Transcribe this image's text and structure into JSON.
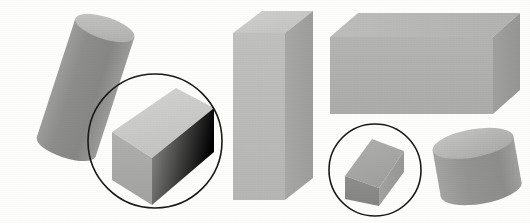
{
  "figure": {
    "background_color": "#fdfdfc",
    "width": 530,
    "height": 223,
    "annotation_stroke_color": "#1a1a1a",
    "annotation_stroke_width": 1.6,
    "shape_count": 6,
    "circled_count": 2
  },
  "palette": {
    "light_face": "#c9c9c7",
    "lighter_face": "#d2d2d0",
    "mid_face": "#b3b3b1",
    "mid_face_alt": "#adadab",
    "dark_face": "#8f8f8e",
    "darker_face": "#7f7f7e",
    "cylinder_body": "#8c8c8b",
    "cylinder_body_light": "#9a9a99",
    "cylinder_top": "#bcbcba",
    "outline": "#1a1a1a"
  },
  "shapes": [
    {
      "id": "tilted-cylinder",
      "name": "tilted-cylinder",
      "type": "cylinder",
      "label": "Tilted cylinder (upper left)",
      "circled": false,
      "center": [
        86,
        86
      ],
      "approx_bbox": [
        28,
        18,
        122,
        155
      ],
      "tilt_degrees": 18,
      "body_color": "#8c8c8b",
      "top_color": "#bcbcba"
    },
    {
      "id": "circled-cuboid-left",
      "name": "circled-cuboid-left",
      "type": "cuboid",
      "label": "Cuboid in circle (left)",
      "circled": true,
      "circle_center": [
        155,
        141
      ],
      "circle_radius": 67,
      "top_color": "#cfcfcd",
      "front_color": "#a9a9a7",
      "side_color": "#8f8f8e"
    },
    {
      "id": "tall-box",
      "name": "tall-box",
      "type": "cuboid",
      "label": "Tall vertical box (center)",
      "circled": false,
      "approx_bbox": [
        233,
        10,
        80,
        190
      ],
      "top_color": "#cbcbc9",
      "front_color": "#bcbcba",
      "side_color": "#a2a2a0"
    },
    {
      "id": "wide-box",
      "name": "wide-box",
      "type": "cuboid",
      "label": "Wide horizontal box (upper right)",
      "circled": false,
      "approx_bbox": [
        330,
        12,
        190,
        105
      ],
      "top_color": "#b8b8b6",
      "front_color": "#b0b0ae",
      "side_color": "#9a9a98"
    },
    {
      "id": "circled-cuboid-right",
      "name": "circled-cuboid-right",
      "type": "cuboid",
      "label": "Cuboid in circle (right)",
      "circled": true,
      "circle_center": [
        375,
        170
      ],
      "circle_radius": 46,
      "top_color": "#a8a8a6",
      "front_color": "#8a8a89",
      "side_color": "#9f9f9d"
    },
    {
      "id": "short-cylinder",
      "name": "short-cylinder",
      "type": "cylinder",
      "label": "Short wide cylinder (lower right)",
      "circled": false,
      "approx_bbox": [
        435,
        132,
        85,
        70
      ],
      "body_color": "#98989 6",
      "top_color": "#b9b9b7"
    }
  ]
}
